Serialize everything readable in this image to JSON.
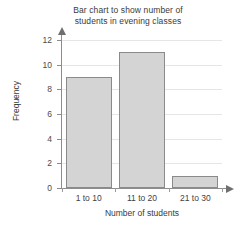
{
  "chart_data": {
    "type": "bar",
    "title": "Bar chart to show number of students in evening classes",
    "title_lines": [
      "Bar chart to show number of",
      "students in evening classes"
    ],
    "categories": [
      "1 to 10",
      "11 to 20",
      "21 to 30"
    ],
    "values": [
      9,
      11,
      1
    ],
    "xlabel": "Number of students",
    "ylabel": "Frequency",
    "ylim": [
      0,
      12
    ],
    "ytick_labels": [
      "0",
      "2",
      "4",
      "6",
      "8",
      "10",
      "12"
    ],
    "ytick_values": [
      0,
      2,
      4,
      6,
      8,
      10,
      12
    ],
    "grid": true,
    "legend": null,
    "colors": {
      "bar_fill": "#d4d4d4",
      "bar_border": "#8a8a8a",
      "gridline": "#e6e6e6",
      "axis": "#8d8d8d",
      "text": "#3a3a3a",
      "background": "#ffffff"
    }
  }
}
